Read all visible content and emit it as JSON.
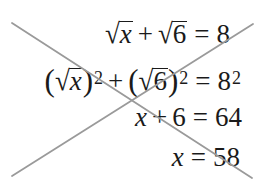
{
  "equations": {
    "row1": {
      "sqrt_a": "x",
      "plus": "+",
      "sqrt_b": "6",
      "equals": "=",
      "rhs": "8"
    },
    "row2": {
      "open_paren_a": "(",
      "sqrt_a": "x",
      "close_paren_a": ")",
      "exp_a": "2",
      "plus": "+",
      "open_paren_b": "(",
      "sqrt_b": "6",
      "close_paren_b": ")",
      "exp_b": "2",
      "equals": "=",
      "rhs_base": "8",
      "rhs_exp": "2"
    },
    "row3": {
      "lhs_var": "x",
      "plus": "+",
      "lhs_const": "6",
      "equals": "=",
      "rhs": "64"
    },
    "row4": {
      "lhs_var": "x",
      "equals": "=",
      "rhs": "58"
    }
  },
  "symbols": {
    "radical": "√"
  },
  "cross_out": {
    "color": "#9a9a9a",
    "line_a": {
      "x1": 12,
      "y1": 23,
      "x2": 252,
      "y2": 178
    },
    "line_b": {
      "x1": 12,
      "y1": 176,
      "x2": 253,
      "y2": 24
    }
  }
}
